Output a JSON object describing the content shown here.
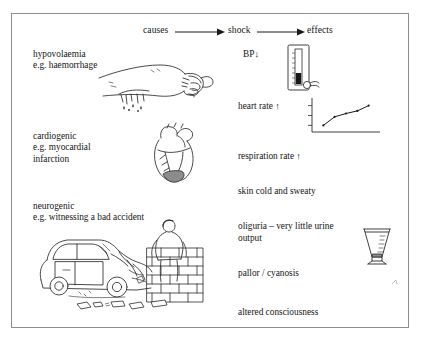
{
  "figure": {
    "background_color": "#ffffff",
    "border_color": "#8d8d8d",
    "ink_color": "#1a1a1a"
  },
  "header": {
    "causes_label": "causes",
    "shock_label": "shock",
    "effects_label": "effects",
    "arrow_1_name": "arrow-causes-to-shock",
    "arrow_2_name": "arrow-shock-to-effects"
  },
  "causes": [
    {
      "id": "hypovolaemic",
      "line1": "hypovolaemia",
      "line2": "e.g. haemorrhage",
      "illustration": "bleeding-arm-illustration"
    },
    {
      "id": "cardiogenic",
      "line1": "cardiogenic",
      "line2": "e.g. myocardial",
      "line3": "infarction",
      "illustration": "heart-infarction-illustration"
    },
    {
      "id": "neurogenic",
      "line1": "neurogenic",
      "line2": "e.g. witnessing a bad accident",
      "illustration": "car-crash-illustration"
    }
  ],
  "effects": [
    {
      "id": "bp",
      "label": "BP",
      "trend": "↓",
      "icon": "sphygmomanometer-icon"
    },
    {
      "id": "heart_rate",
      "label": "heart rate",
      "trend": "↑",
      "icon": "line-chart-icon"
    },
    {
      "id": "respiration_rate",
      "label": "respiration rate",
      "trend": "↑",
      "icon": ""
    },
    {
      "id": "skin",
      "label": "skin cold and sweaty",
      "trend": "",
      "icon": ""
    },
    {
      "id": "oliguria",
      "line1": "oliguria – very little urine",
      "line2": "output",
      "icon": "measuring-beaker-icon"
    },
    {
      "id": "pallor",
      "label": "pallor / cyanosis",
      "trend": "",
      "icon": ""
    },
    {
      "id": "consciousness",
      "label": "altered consciousness",
      "trend": "",
      "icon": ""
    }
  ],
  "chart_data": {
    "type": "line",
    "title": "",
    "xlabel": "",
    "ylabel": "",
    "x": [
      1,
      2,
      3,
      4,
      5
    ],
    "values": [
      1.0,
      2.3,
      2.8,
      3.2,
      4.0
    ],
    "ylim": [
      0,
      5
    ],
    "xlim": [
      0,
      6
    ],
    "y_ticks": [
      1,
      2.5,
      4
    ],
    "grid": false,
    "legend": "none",
    "marker": "dot"
  }
}
